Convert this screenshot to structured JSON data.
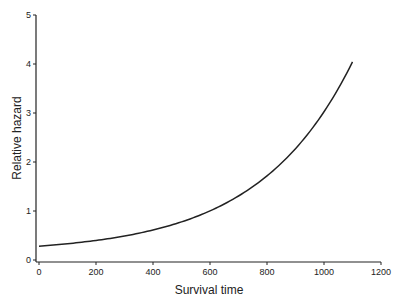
{
  "chart_data": {
    "type": "line",
    "title": "",
    "xlabel": "Survival time",
    "ylabel": "Relative hazard",
    "xlim": [
      0,
      1200
    ],
    "ylim": [
      0,
      5
    ],
    "xticks": [
      0,
      200,
      400,
      600,
      800,
      1000,
      1200
    ],
    "yticks": [
      0,
      1,
      2,
      3,
      4,
      5
    ],
    "grid": false,
    "legend": null,
    "series": [
      {
        "name": "Relative hazard",
        "color": "#222222",
        "x": [
          0,
          100,
          200,
          300,
          400,
          500,
          600,
          700,
          800,
          900,
          1000,
          1100
        ],
        "y": [
          0.14,
          0.19,
          0.26,
          0.35,
          0.47,
          0.63,
          0.86,
          1.16,
          1.57,
          2.13,
          2.88,
          3.9
        ]
      }
    ]
  }
}
